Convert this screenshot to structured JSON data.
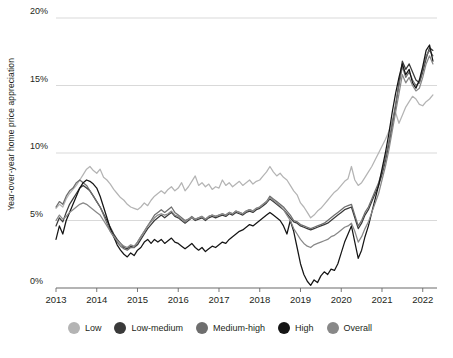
{
  "chart_data": {
    "type": "line",
    "title": "",
    "xlabel": "",
    "ylabel": "Year-over-year home price appreciation",
    "ylim": [
      0,
      20
    ],
    "xlim": [
      2013,
      2022.35
    ],
    "grid": true,
    "legend_position": "bottom",
    "ytick_labels": [
      "0%",
      "5%",
      "10%",
      "15%",
      "20%"
    ],
    "ytick_values": [
      0,
      5,
      10,
      15,
      20
    ],
    "xtick_labels": [
      "2013",
      "2014",
      "2015",
      "2016",
      "2017",
      "2018",
      "2019",
      "2020",
      "2021",
      "2022"
    ],
    "xtick_values": [
      2013,
      2014,
      2015,
      2016,
      2017,
      2018,
      2019,
      2020,
      2021,
      2022
    ],
    "x": [
      2013.0,
      2013.083,
      2013.167,
      2013.25,
      2013.333,
      2013.417,
      2013.5,
      2013.583,
      2013.667,
      2013.75,
      2013.833,
      2013.917,
      2014.0,
      2014.083,
      2014.167,
      2014.25,
      2014.333,
      2014.417,
      2014.5,
      2014.583,
      2014.667,
      2014.75,
      2014.833,
      2014.917,
      2015.0,
      2015.083,
      2015.167,
      2015.25,
      2015.333,
      2015.417,
      2015.5,
      2015.583,
      2015.667,
      2015.75,
      2015.833,
      2015.917,
      2016.0,
      2016.083,
      2016.167,
      2016.25,
      2016.333,
      2016.417,
      2016.5,
      2016.583,
      2016.667,
      2016.75,
      2016.833,
      2016.917,
      2017.0,
      2017.083,
      2017.167,
      2017.25,
      2017.333,
      2017.417,
      2017.5,
      2017.583,
      2017.667,
      2017.75,
      2017.833,
      2017.917,
      2018.0,
      2018.083,
      2018.167,
      2018.25,
      2018.333,
      2018.417,
      2018.5,
      2018.583,
      2018.667,
      2018.75,
      2018.833,
      2018.917,
      2019.0,
      2019.083,
      2019.167,
      2019.25,
      2019.333,
      2019.417,
      2019.5,
      2019.583,
      2019.667,
      2019.75,
      2019.833,
      2019.917,
      2020.0,
      2020.083,
      2020.167,
      2020.25,
      2020.333,
      2020.417,
      2020.5,
      2020.583,
      2020.667,
      2020.75,
      2020.833,
      2020.917,
      2021.0,
      2021.083,
      2021.167,
      2021.25,
      2021.333,
      2021.417,
      2021.5,
      2021.583,
      2021.667,
      2021.75,
      2021.833,
      2021.917,
      2022.0,
      2022.083,
      2022.167,
      2022.25
    ],
    "series": [
      {
        "name": "Low",
        "color": "#b4b4b4",
        "values": [
          5.9,
          6.2,
          6.0,
          6.6,
          7.0,
          7.3,
          7.6,
          8.0,
          8.4,
          8.8,
          9.0,
          8.7,
          8.5,
          8.8,
          8.2,
          8.0,
          7.7,
          7.3,
          7.0,
          6.7,
          6.5,
          6.2,
          6.0,
          5.9,
          5.8,
          6.0,
          6.3,
          6.1,
          6.5,
          6.8,
          7.0,
          7.2,
          7.0,
          7.3,
          7.5,
          7.2,
          7.4,
          7.8,
          7.2,
          7.5,
          7.9,
          8.3,
          7.6,
          7.8,
          7.5,
          7.7,
          7.3,
          7.5,
          7.4,
          8.0,
          7.6,
          7.8,
          7.5,
          7.7,
          7.9,
          7.6,
          7.8,
          8.0,
          7.7,
          7.9,
          8.0,
          8.3,
          8.6,
          9.0,
          8.6,
          8.3,
          8.5,
          8.2,
          8.0,
          7.6,
          7.2,
          6.9,
          6.3,
          6.0,
          5.6,
          5.2,
          5.4,
          5.7,
          5.9,
          6.2,
          6.5,
          6.8,
          7.1,
          7.3,
          7.6,
          7.9,
          8.1,
          9.0,
          8.0,
          7.6,
          7.8,
          8.2,
          8.6,
          9.0,
          9.5,
          10.0,
          10.5,
          11.0,
          11.6,
          12.4,
          13.0,
          12.2,
          12.8,
          13.4,
          13.8,
          14.2,
          14.0,
          13.6,
          13.5,
          13.8,
          14.0,
          14.3
        ]
      },
      {
        "name": "Low-medium",
        "color": "#3a3a3a",
        "values": [
          4.6,
          5.2,
          4.9,
          5.6,
          6.2,
          6.6,
          7.0,
          7.4,
          7.6,
          7.4,
          7.2,
          6.8,
          6.4,
          6.0,
          5.5,
          5.0,
          4.5,
          4.0,
          3.6,
          3.3,
          3.0,
          2.9,
          3.1,
          3.0,
          3.2,
          3.6,
          4.0,
          4.4,
          4.7,
          5.0,
          5.2,
          5.4,
          5.2,
          5.4,
          5.6,
          5.3,
          5.2,
          5.0,
          4.8,
          5.0,
          5.2,
          5.0,
          5.1,
          5.2,
          5.0,
          5.2,
          5.3,
          5.2,
          5.3,
          5.4,
          5.3,
          5.5,
          5.4,
          5.6,
          5.5,
          5.4,
          5.6,
          5.7,
          5.6,
          5.8,
          5.9,
          6.1,
          6.3,
          6.6,
          6.4,
          6.2,
          6.0,
          5.8,
          5.5,
          5.2,
          4.9,
          4.8,
          4.6,
          4.5,
          4.4,
          4.3,
          4.4,
          4.5,
          4.6,
          4.7,
          4.8,
          5.0,
          5.2,
          5.4,
          5.6,
          5.8,
          5.9,
          6.0,
          5.2,
          4.4,
          4.8,
          5.4,
          5.8,
          6.4,
          7.0,
          7.6,
          8.4,
          9.4,
          10.6,
          12.0,
          13.4,
          15.2,
          16.8,
          16.2,
          16.6,
          16.0,
          15.4,
          15.2,
          16.0,
          17.0,
          17.8,
          17.6
        ]
      },
      {
        "name": "Medium-high",
        "color": "#6e6e6e",
        "values": [
          6.0,
          6.4,
          6.2,
          6.8,
          7.2,
          7.4,
          7.8,
          8.0,
          7.8,
          7.6,
          7.2,
          6.8,
          6.4,
          6.0,
          5.4,
          4.8,
          4.2,
          3.8,
          3.4,
          3.1,
          2.9,
          2.8,
          3.0,
          3.0,
          3.4,
          3.8,
          4.2,
          4.6,
          5.0,
          5.4,
          5.6,
          5.8,
          5.6,
          5.8,
          6.0,
          5.6,
          5.4,
          5.2,
          5.0,
          5.1,
          5.3,
          5.1,
          5.2,
          5.3,
          5.1,
          5.3,
          5.4,
          5.3,
          5.4,
          5.5,
          5.4,
          5.6,
          5.5,
          5.7,
          5.6,
          5.5,
          5.7,
          5.8,
          5.7,
          5.9,
          6.0,
          6.2,
          6.4,
          6.8,
          6.6,
          6.4,
          6.2,
          6.0,
          5.7,
          5.4,
          5.0,
          4.9,
          4.7,
          4.6,
          4.5,
          4.4,
          4.5,
          4.6,
          4.7,
          4.8,
          5.0,
          5.2,
          5.4,
          5.6,
          5.8,
          6.0,
          6.1,
          6.2,
          5.4,
          4.6,
          5.0,
          5.6,
          6.0,
          6.6,
          7.2,
          7.8,
          8.6,
          9.6,
          10.8,
          12.2,
          13.6,
          15.0,
          16.4,
          15.6,
          16.0,
          15.4,
          15.0,
          15.2,
          16.2,
          17.2,
          17.6,
          17.2
        ]
      },
      {
        "name": "High",
        "color": "#151515",
        "values": [
          3.6,
          4.6,
          4.0,
          5.0,
          5.6,
          6.2,
          6.8,
          7.4,
          7.8,
          8.0,
          7.9,
          7.7,
          7.4,
          6.8,
          6.0,
          5.2,
          4.4,
          3.8,
          3.2,
          2.8,
          2.5,
          2.3,
          2.6,
          2.4,
          2.8,
          3.0,
          3.4,
          3.6,
          3.3,
          3.6,
          3.4,
          3.6,
          3.3,
          3.5,
          3.7,
          3.4,
          3.3,
          3.1,
          2.9,
          3.1,
          3.3,
          3.0,
          2.8,
          3.0,
          2.7,
          2.9,
          3.1,
          3.0,
          3.2,
          3.4,
          3.3,
          3.6,
          3.8,
          4.0,
          4.2,
          4.3,
          4.5,
          4.7,
          4.6,
          4.8,
          5.0,
          5.2,
          5.4,
          5.6,
          5.4,
          5.2,
          5.0,
          4.6,
          4.0,
          5.0,
          4.2,
          3.0,
          1.8,
          1.0,
          0.5,
          0.2,
          0.6,
          0.4,
          0.9,
          1.2,
          1.0,
          1.4,
          1.3,
          1.8,
          2.6,
          3.4,
          4.0,
          4.6,
          3.4,
          2.2,
          2.8,
          3.8,
          4.6,
          5.6,
          6.6,
          7.6,
          8.8,
          10.0,
          11.4,
          13.0,
          14.4,
          15.6,
          16.6,
          15.8,
          16.2,
          15.2,
          14.8,
          15.4,
          16.4,
          17.6,
          18.0,
          16.8
        ]
      },
      {
        "name": "Overall",
        "color": "#888888",
        "values": [
          5.0,
          5.4,
          5.1,
          5.3,
          5.6,
          5.8,
          6.0,
          6.2,
          6.3,
          6.2,
          6.0,
          5.8,
          5.6,
          5.4,
          5.0,
          4.6,
          4.2,
          3.8,
          3.5,
          3.3,
          3.1,
          3.0,
          3.2,
          3.1,
          3.4,
          3.8,
          4.2,
          4.6,
          4.9,
          5.2,
          5.4,
          5.5,
          5.4,
          5.5,
          5.7,
          5.4,
          5.3,
          5.1,
          4.9,
          5.1,
          5.2,
          5.1,
          5.2,
          5.3,
          5.1,
          5.3,
          5.4,
          5.3,
          5.4,
          5.5,
          5.4,
          5.6,
          5.5,
          5.7,
          5.6,
          5.5,
          5.7,
          5.8,
          5.7,
          5.9,
          6.0,
          6.2,
          6.4,
          6.7,
          6.5,
          6.3,
          6.1,
          5.8,
          5.4,
          5.0,
          4.4,
          4.0,
          3.6,
          3.3,
          3.1,
          3.0,
          3.2,
          3.3,
          3.4,
          3.5,
          3.6,
          3.8,
          3.9,
          4.1,
          4.3,
          4.5,
          4.6,
          4.8,
          4.2,
          3.4,
          3.8,
          4.4,
          4.9,
          5.6,
          6.3,
          7.0,
          8.0,
          9.0,
          10.2,
          11.6,
          13.0,
          14.4,
          15.8,
          15.2,
          15.6,
          15.0,
          14.6,
          14.8,
          15.6,
          16.6,
          17.2,
          16.6
        ]
      }
    ]
  },
  "legend": {
    "items": [
      {
        "label": "Low",
        "color": "#b4b4b4"
      },
      {
        "label": "Low-medium",
        "color": "#3a3a3a"
      },
      {
        "label": "Medium-high",
        "color": "#6e6e6e"
      },
      {
        "label": "High",
        "color": "#151515"
      },
      {
        "label": "Overall",
        "color": "#888888"
      }
    ]
  },
  "axes": {
    "y_title": "Year-over-year home price appreciation"
  }
}
